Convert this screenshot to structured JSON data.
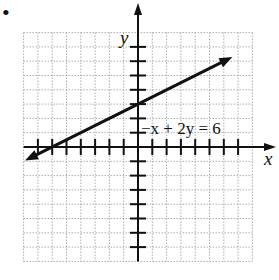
{
  "chart_data": {
    "type": "line",
    "title": "",
    "equation_label": "−x + 2y = 6",
    "xlabel": "x",
    "ylabel": "y",
    "xlim": [
      -8,
      8
    ],
    "ylim": [
      -8,
      8
    ],
    "grid": true,
    "grid_style": "dotted",
    "tick_spacing": 1,
    "x_ticks": [
      -7,
      -6,
      -5,
      -4,
      -3,
      -2,
      -1,
      1,
      2,
      3,
      4,
      5,
      6,
      7
    ],
    "y_ticks": [
      -7,
      -6,
      -5,
      -4,
      -3,
      -2,
      -1,
      1,
      2,
      3,
      4,
      5,
      6,
      7
    ],
    "series": [
      {
        "name": "−x + 2y = 6",
        "equation": "y = 0.5x + 3",
        "slope": 0.5,
        "intercept": 3,
        "x_intercept": -6,
        "y_intercept": 3,
        "x": [
          -7.9,
          6.6
        ],
        "y": [
          -0.95,
          6.3
        ],
        "arrows": "both"
      }
    ],
    "legend": null
  },
  "labels": {
    "bullet": "•",
    "x_axis": "x",
    "y_axis": "y",
    "equation": "−x + 2y = 6"
  },
  "colors": {
    "axis": "#111111",
    "line": "#111111",
    "grid": "#9a9a9a",
    "background": "#ffffff"
  }
}
